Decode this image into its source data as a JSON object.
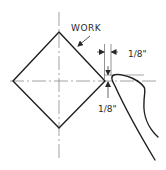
{
  "diagram": {
    "type": "machining-setup-sketch",
    "labels": {
      "work": "WORK",
      "horizontal_clearance": "1/8\"",
      "vertical_clearance": "1/8\""
    },
    "elements": {
      "workpiece_shape": "square rotated 45° (diamond)",
      "centerlines": [
        "vertical",
        "horizontal"
      ],
      "tool": "cutting tool tip positioned at right corner of work",
      "dimensions": [
        {
          "label": "1/8\"",
          "orientation": "horizontal",
          "meaning": "tool offset from work corner"
        },
        {
          "label": "1/8\"",
          "orientation": "vertical",
          "meaning": "tool height above centerline"
        }
      ]
    },
    "colors": {
      "line": "#1e1e1e",
      "centerline": "#6a6a6a",
      "background": "#ffffff"
    }
  }
}
